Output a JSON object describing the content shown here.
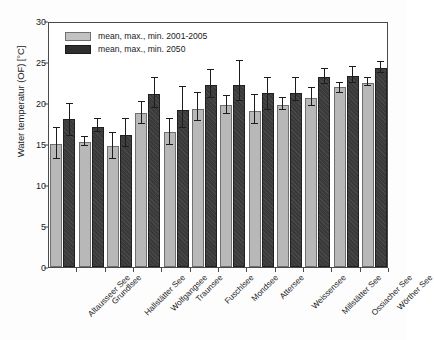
{
  "chart_data": {
    "type": "bar",
    "title": "",
    "subtitle": "",
    "xlabel": "",
    "ylabel": "Water temperatur (OF) [°C]",
    "ylim": [
      0,
      30
    ],
    "yticks": [
      0,
      5,
      10,
      15,
      20,
      25,
      30
    ],
    "grid": false,
    "legend_position": "upper-left",
    "categories": [
      "Altausseer See",
      "Grundlsee",
      "Hallstätter See",
      "Wolfgangsee",
      "Traunsee",
      "Fuschlsee",
      "Mondsee",
      "Attersee",
      "Weissensee",
      "Millstätter See",
      "Ossiacher See",
      "Wörther See"
    ],
    "series": [
      {
        "name": "mean, max., min. 2001-2005",
        "color": "#b8b8b8",
        "values": [
          15.0,
          15.3,
          14.8,
          18.8,
          16.5,
          19.3,
          19.7,
          19.0,
          19.8,
          20.6,
          22.0,
          22.5
        ],
        "err_high": [
          17.0,
          15.9,
          16.3,
          20.1,
          18.1,
          21.2,
          20.9,
          21.0,
          20.6,
          21.8,
          22.4,
          23.0
        ],
        "err_low": [
          13.2,
          14.8,
          13.2,
          17.4,
          14.9,
          17.8,
          18.6,
          17.5,
          19.2,
          19.6,
          21.2,
          22.1
        ]
      },
      {
        "name": "mean, max., min. 2050",
        "color": "#3a3a3a",
        "values": [
          18.1,
          17.1,
          16.1,
          21.1,
          19.2,
          22.2,
          22.2,
          21.2,
          21.2,
          23.2,
          23.3,
          24.3
        ],
        "err_high": [
          19.9,
          18.1,
          18.0,
          23.0,
          22.0,
          24.0,
          25.1,
          23.0,
          23.1,
          24.1,
          24.4,
          25.0
        ],
        "err_low": [
          16.0,
          16.5,
          14.6,
          19.4,
          17.0,
          20.6,
          20.3,
          19.2,
          20.3,
          22.3,
          22.5,
          23.7
        ]
      }
    ]
  },
  "legend": {
    "items": [
      {
        "label": "mean, max., min. 2001-2005",
        "swatch": "light"
      },
      {
        "label": "mean, max., min.  2050",
        "swatch": "dark"
      }
    ]
  },
  "axes": {
    "y_title": "Water temperatur (OF) [°C]",
    "y_tick_labels": [
      "30",
      "25",
      "20",
      "15",
      "10",
      "5",
      "0"
    ]
  }
}
